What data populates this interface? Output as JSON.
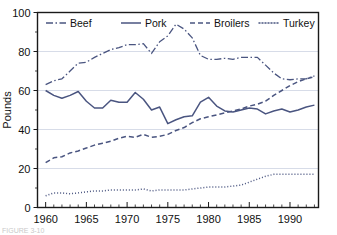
{
  "chart_data": {
    "type": "line",
    "title": "",
    "xlabel": "",
    "ylabel": "Pounds",
    "xlim": [
      1959,
      1993.5
    ],
    "ylim": [
      0,
      100
    ],
    "grid": "horizontal-major",
    "legend_position": "top-inside",
    "x_tick_labels": [
      "1960",
      "1965",
      "1970",
      "1975",
      "1980",
      "1985",
      "1990"
    ],
    "x_tick_values": [
      1960,
      1965,
      1970,
      1975,
      1980,
      1985,
      1990
    ],
    "x_minor_step": 1,
    "y_tick_labels": [
      "0",
      "20",
      "40",
      "60",
      "80",
      "100"
    ],
    "y_tick_values": [
      0,
      20,
      40,
      60,
      80,
      100
    ],
    "y_minor_step": 10,
    "x": [
      1960,
      1961,
      1962,
      1963,
      1964,
      1965,
      1966,
      1967,
      1968,
      1969,
      1970,
      1971,
      1972,
      1973,
      1974,
      1975,
      1976,
      1977,
      1978,
      1979,
      1980,
      1981,
      1982,
      1983,
      1984,
      1985,
      1986,
      1987,
      1988,
      1989,
      1990,
      1991,
      1992,
      1993
    ],
    "series": [
      {
        "name": "Beef",
        "style": "dash-dot",
        "color": "#4a5580",
        "values": [
          63.0,
          65.0,
          66.0,
          70.0,
          74.0,
          74.5,
          77.0,
          79.0,
          81.0,
          82.0,
          83.5,
          83.5,
          84.0,
          79.0,
          85.0,
          88.0,
          94.0,
          91.5,
          87.0,
          78.0,
          76.0,
          76.0,
          76.5,
          76.0,
          77.0,
          77.0,
          77.0,
          73.0,
          69.0,
          66.0,
          65.5,
          66.0,
          66.0,
          67.5
        ]
      },
      {
        "name": "Pork",
        "style": "solid",
        "color": "#4a5580",
        "values": [
          60.0,
          57.5,
          56.0,
          57.5,
          59.5,
          54.5,
          51.0,
          51.0,
          55.0,
          54.0,
          54.0,
          59.0,
          55.5,
          50.0,
          51.5,
          43.0,
          45.0,
          46.5,
          47.0,
          54.0,
          56.5,
          52.0,
          49.5,
          49.0,
          50.0,
          51.0,
          50.5,
          48.0,
          49.5,
          50.5,
          49.0,
          50.0,
          51.5,
          52.5
        ]
      },
      {
        "name": "Broilers",
        "style": "dashed",
        "color": "#4a5580",
        "values": [
          23.0,
          25.5,
          26.0,
          28.0,
          29.0,
          30.5,
          32.0,
          33.0,
          34.0,
          35.5,
          36.5,
          36.0,
          37.5,
          36.0,
          36.5,
          37.5,
          39.5,
          41.0,
          43.5,
          45.5,
          46.5,
          47.5,
          48.5,
          49.5,
          50.5,
          52.0,
          53.0,
          54.5,
          57.5,
          60.0,
          62.5,
          64.5,
          66.0,
          67.0
        ]
      },
      {
        "name": "Turkey",
        "style": "dotted",
        "color": "#4a5580",
        "values": [
          6.0,
          7.5,
          7.5,
          7.0,
          7.5,
          8.0,
          8.5,
          8.5,
          9.0,
          9.0,
          9.0,
          9.0,
          9.5,
          8.5,
          9.0,
          9.0,
          9.0,
          9.0,
          9.5,
          10.0,
          10.5,
          10.5,
          10.5,
          11.0,
          11.5,
          13.0,
          14.5,
          16.0,
          17.0,
          17.0,
          17.0,
          17.0,
          17.0,
          17.0
        ]
      }
    ]
  },
  "legend": {
    "items": [
      {
        "label": "Beef"
      },
      {
        "label": "Pork"
      },
      {
        "label": "Broilers"
      },
      {
        "label": "Turkey"
      }
    ]
  },
  "caption": {
    "text": "FIGURE 3-10"
  }
}
